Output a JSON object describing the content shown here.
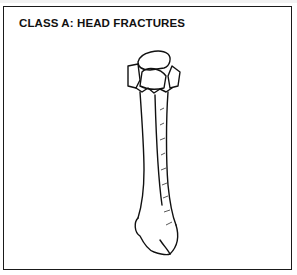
{
  "figure": {
    "title": "CLASS A: HEAD FRACTURES",
    "illustration": "fractured-bone-head-drawing"
  },
  "colors": {
    "ink": "#111111",
    "background": "#ffffff"
  }
}
